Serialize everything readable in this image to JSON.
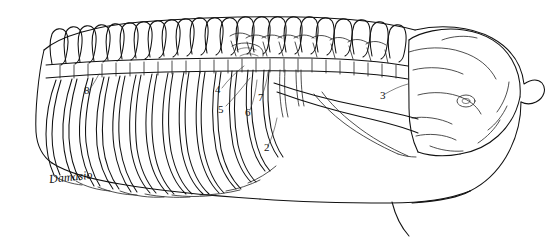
{
  "figure": {
    "medium": "pen-and-ink line drawing",
    "background_color": "#ffffff",
    "ink_color": "#111111",
    "signature": "Damasio",
    "labels": [
      {
        "id": "label-8",
        "text": "8",
        "x": 84,
        "y": 91
      },
      {
        "id": "label-4",
        "text": "4",
        "x": 215,
        "y": 90
      },
      {
        "id": "label-5",
        "text": "5",
        "x": 218,
        "y": 110
      },
      {
        "id": "label-6",
        "text": "6",
        "x": 245,
        "y": 113
      },
      {
        "id": "label-7",
        "text": "7",
        "x": 258,
        "y": 98
      },
      {
        "id": "label-3",
        "text": "3",
        "x": 380,
        "y": 96
      },
      {
        "id": "label-2",
        "text": "2",
        "x": 264,
        "y": 148
      }
    ]
  }
}
